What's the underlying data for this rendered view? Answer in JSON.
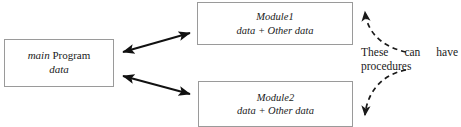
{
  "figure": {
    "clipped_note": "can have its own data",
    "boxes": {
      "main": {
        "title_italic": "main",
        "title_rest": " Program",
        "subtitle": "data"
      },
      "module1": {
        "title": "Module1",
        "subtitle": "data + Other data"
      },
      "module2": {
        "title": "Module2",
        "subtitle": "data + Other data"
      }
    },
    "annotation": {
      "line1_word1": "These",
      "line1_word2": "can",
      "line1_word3": "have",
      "line2": "procedures"
    },
    "colors": {
      "box_border": "#9a9a9a",
      "arrow": "#111111",
      "dashed_arrow": "#1a1a1a",
      "text": "#1a1a1a",
      "background": "#ffffff"
    }
  }
}
